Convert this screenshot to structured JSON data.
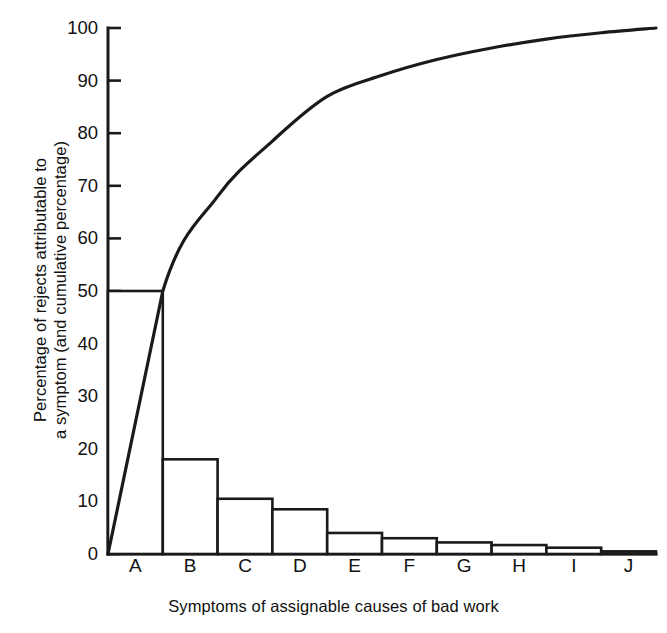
{
  "figure": {
    "kind": "pareto-chart",
    "background": "#ffffff",
    "ink_color": "#1a1a1a"
  },
  "axes": {
    "y_title_line1": "Percentage of rejects attributable to",
    "y_title_line2": "a symptom (and cumulative percentage)",
    "x_title": "Symptoms of assignable causes of bad work",
    "y_ticks": [
      "0",
      "10",
      "20",
      "30",
      "40",
      "50",
      "60",
      "70",
      "80",
      "90",
      "100"
    ],
    "x_ticks": [
      "A",
      "B",
      "C",
      "D",
      "E",
      "F",
      "G",
      "H",
      "I",
      "J"
    ]
  },
  "chart_data": {
    "type": "bar",
    "title": "",
    "subtitle": "",
    "xlabel": "Symptoms of assignable causes of bad work",
    "ylabel": "Percentage of rejects attributable to a symptom (and cumulative percentage)",
    "categories": [
      "A",
      "B",
      "C",
      "D",
      "E",
      "F",
      "G",
      "H",
      "I",
      "J"
    ],
    "ylim": [
      0,
      100
    ],
    "ytick_values": [
      0,
      10,
      20,
      30,
      40,
      50,
      60,
      70,
      80,
      90,
      100
    ],
    "grid": false,
    "legend": "none",
    "series": [
      {
        "name": "Percentage of rejects attributable to a symptom",
        "type": "bar",
        "values": [
          50,
          18,
          10.5,
          8.5,
          4,
          3,
          2.2,
          1.7,
          1.2,
          0.5
        ]
      },
      {
        "name": "Cumulative percentage",
        "type": "line",
        "values": [
          50,
          68,
          78.5,
          87,
          91,
          94,
          96.2,
          97.9,
          99.1,
          100
        ],
        "starts_at_origin": true,
        "origin_value": 0
      }
    ]
  }
}
